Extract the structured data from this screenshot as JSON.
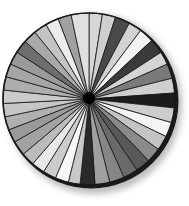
{
  "figure": {
    "type": "radial-wedge-wheel",
    "center": [
      89,
      99
    ],
    "radius": 86,
    "rim_color": "#1a1a1a",
    "hub_color": "#000000",
    "divider_color": "#1a1a1a",
    "shadow_color": "#bdbdbd"
  },
  "chart_data": {
    "type": "pie",
    "title": "",
    "start_angle_deg": 0,
    "direction": "clockwise",
    "wedges": [
      {
        "start": 0,
        "end": 9,
        "color": "#d6d6d6"
      },
      {
        "start": 9,
        "end": 18,
        "color": "#cfcfcf"
      },
      {
        "start": 18,
        "end": 28,
        "color": "#4a4a4a"
      },
      {
        "start": 28,
        "end": 37,
        "color": "#d2d2d2"
      },
      {
        "start": 37,
        "end": 47,
        "color": "#f2f2f2"
      },
      {
        "start": 47,
        "end": 57,
        "color": "#3a3a3a"
      },
      {
        "start": 57,
        "end": 66,
        "color": "#d4d4d4"
      },
      {
        "start": 66,
        "end": 76,
        "color": "#7a7a7a"
      },
      {
        "start": 76,
        "end": 86,
        "color": "#cfcfcf"
      },
      {
        "start": 86,
        "end": 96,
        "color": "#1c1c1c"
      },
      {
        "start": 96,
        "end": 106,
        "color": "#cdcdcd"
      },
      {
        "start": 106,
        "end": 116,
        "color": "#f4f4f4"
      },
      {
        "start": 116,
        "end": 126,
        "color": "#c4c4c4"
      },
      {
        "start": 126,
        "end": 136,
        "color": "#8a8a8a"
      },
      {
        "start": 136,
        "end": 146,
        "color": "#595959"
      },
      {
        "start": 146,
        "end": 156,
        "color": "#6a6a6a"
      },
      {
        "start": 156,
        "end": 166,
        "color": "#868686"
      },
      {
        "start": 166,
        "end": 176,
        "color": "#a0a0a0"
      },
      {
        "start": 176,
        "end": 186,
        "color": "#2a2a2a"
      },
      {
        "start": 186,
        "end": 194,
        "color": "#c8c8c8"
      },
      {
        "start": 194,
        "end": 203,
        "color": "#f6f6f6"
      },
      {
        "start": 203,
        "end": 212,
        "color": "#cccccc"
      },
      {
        "start": 212,
        "end": 221,
        "color": "#e8e8e8"
      },
      {
        "start": 221,
        "end": 230,
        "color": "#bcbcbc"
      },
      {
        "start": 230,
        "end": 240,
        "color": "#a2a2a2"
      },
      {
        "start": 240,
        "end": 249,
        "color": "#9a9a9a"
      },
      {
        "start": 249,
        "end": 258,
        "color": "#b0b0b0"
      },
      {
        "start": 258,
        "end": 267,
        "color": "#c6c6c6"
      },
      {
        "start": 267,
        "end": 276,
        "color": "#cbcbcb"
      },
      {
        "start": 276,
        "end": 285,
        "color": "#adadad"
      },
      {
        "start": 285,
        "end": 294,
        "color": "#a6a6a6"
      },
      {
        "start": 294,
        "end": 303,
        "color": "#9a9a9a"
      },
      {
        "start": 303,
        "end": 312,
        "color": "#6e6e6e"
      },
      {
        "start": 312,
        "end": 321,
        "color": "#a8a8a8"
      },
      {
        "start": 321,
        "end": 330,
        "color": "#c4c4c4"
      },
      {
        "start": 330,
        "end": 339,
        "color": "#ececec"
      },
      {
        "start": 339,
        "end": 348,
        "color": "#a0a0a0"
      },
      {
        "start": 348,
        "end": 360,
        "color": "#e0e0e0"
      }
    ],
    "legend": [],
    "labels": []
  }
}
